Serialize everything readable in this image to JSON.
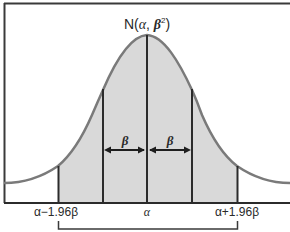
{
  "diagram": {
    "title_parts": {
      "prefix": "N(",
      "mean": "α",
      "sep": ", ",
      "sd": "β",
      "sup": "2",
      "suffix": ")"
    },
    "distribution": "normal",
    "mean_symbol": "α",
    "sd_symbol": "β",
    "x_labels": {
      "left": "α−1.96β",
      "center": "α",
      "right": "α+1.96β"
    },
    "span_labels": {
      "left": "β",
      "right": "β"
    },
    "vertical_lines": [
      "α−1.96β",
      "α−β",
      "α",
      "α+β",
      "α+1.96β"
    ],
    "shaded_region": "α−1.96β to α+1.96β",
    "bracket": "α−1.96β to α+1.96β",
    "colors": {
      "curve": "#7a7a7a",
      "fill": "#d9d9d9",
      "lines": "#2b2b2b",
      "frame": "#3a3a3a",
      "background": "#ffffff"
    }
  }
}
